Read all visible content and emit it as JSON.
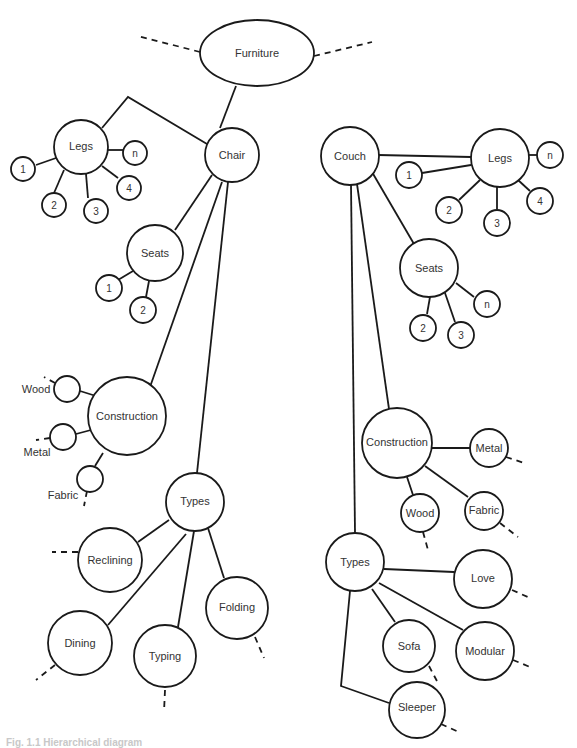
{
  "diagram": {
    "type": "hierarchy",
    "root": "Furniture",
    "nodes": [
      {
        "id": "furniture",
        "label": "Furniture"
      },
      {
        "id": "chair",
        "label": "Chair"
      },
      {
        "id": "chair-legs",
        "label": "Legs"
      },
      {
        "id": "chair-legs-1",
        "label": "1"
      },
      {
        "id": "chair-legs-2",
        "label": "2"
      },
      {
        "id": "chair-legs-3",
        "label": "3"
      },
      {
        "id": "chair-legs-4",
        "label": "4"
      },
      {
        "id": "chair-legs-n",
        "label": "n"
      },
      {
        "id": "chair-seats",
        "label": "Seats"
      },
      {
        "id": "chair-seats-1",
        "label": "1"
      },
      {
        "id": "chair-seats-2",
        "label": "2"
      },
      {
        "id": "chair-construction",
        "label": "Construction"
      },
      {
        "id": "chair-construction-wood",
        "label": "Wood"
      },
      {
        "id": "chair-construction-metal",
        "label": "Metal"
      },
      {
        "id": "chair-construction-fabric",
        "label": "Fabric"
      },
      {
        "id": "chair-types",
        "label": "Types"
      },
      {
        "id": "chair-types-reclining",
        "label": "Reclining"
      },
      {
        "id": "chair-types-dining",
        "label": "Dining"
      },
      {
        "id": "chair-types-typing",
        "label": "Typing"
      },
      {
        "id": "chair-types-folding",
        "label": "Folding"
      },
      {
        "id": "couch",
        "label": "Couch"
      },
      {
        "id": "couch-legs",
        "label": "Legs"
      },
      {
        "id": "couch-legs-1",
        "label": "1"
      },
      {
        "id": "couch-legs-2",
        "label": "2"
      },
      {
        "id": "couch-legs-3",
        "label": "3"
      },
      {
        "id": "couch-legs-4",
        "label": "4"
      },
      {
        "id": "couch-legs-n",
        "label": "n"
      },
      {
        "id": "couch-seats",
        "label": "Seats"
      },
      {
        "id": "couch-seats-2",
        "label": "2"
      },
      {
        "id": "couch-seats-3",
        "label": "3"
      },
      {
        "id": "couch-seats-n",
        "label": "n"
      },
      {
        "id": "couch-construction",
        "label": "Construction"
      },
      {
        "id": "couch-construction-metal",
        "label": "Metal"
      },
      {
        "id": "couch-construction-fabric",
        "label": "Fabric"
      },
      {
        "id": "couch-construction-wood",
        "label": "Wood"
      },
      {
        "id": "couch-types",
        "label": "Types"
      },
      {
        "id": "couch-types-love",
        "label": "Love"
      },
      {
        "id": "couch-types-modular",
        "label": "Modular"
      },
      {
        "id": "couch-types-sofa",
        "label": "Sofa"
      },
      {
        "id": "couch-types-sleeper",
        "label": "Sleeper"
      }
    ],
    "edges": [
      [
        "furniture",
        "chair"
      ],
      [
        "chair",
        "chair-legs"
      ],
      [
        "chair",
        "chair-seats"
      ],
      [
        "chair",
        "chair-construction"
      ],
      [
        "chair",
        "chair-types"
      ],
      [
        "chair-legs",
        "chair-legs-1"
      ],
      [
        "chair-legs",
        "chair-legs-2"
      ],
      [
        "chair-legs",
        "chair-legs-3"
      ],
      [
        "chair-legs",
        "chair-legs-4"
      ],
      [
        "chair-legs",
        "chair-legs-n"
      ],
      [
        "chair-seats",
        "chair-seats-1"
      ],
      [
        "chair-seats",
        "chair-seats-2"
      ],
      [
        "chair-construction",
        "chair-construction-wood"
      ],
      [
        "chair-construction",
        "chair-construction-metal"
      ],
      [
        "chair-construction",
        "chair-construction-fabric"
      ],
      [
        "chair-types",
        "chair-types-reclining"
      ],
      [
        "chair-types",
        "chair-types-dining"
      ],
      [
        "chair-types",
        "chair-types-typing"
      ],
      [
        "chair-types",
        "chair-types-folding"
      ],
      [
        "couch",
        "couch-legs"
      ],
      [
        "couch",
        "couch-seats"
      ],
      [
        "couch",
        "couch-construction"
      ],
      [
        "couch",
        "couch-types"
      ],
      [
        "couch-legs",
        "couch-legs-1"
      ],
      [
        "couch-legs",
        "couch-legs-2"
      ],
      [
        "couch-legs",
        "couch-legs-3"
      ],
      [
        "couch-legs",
        "couch-legs-4"
      ],
      [
        "couch-legs",
        "couch-legs-n"
      ],
      [
        "couch-seats",
        "couch-seats-2"
      ],
      [
        "couch-seats",
        "couch-seats-3"
      ],
      [
        "couch-seats",
        "couch-seats-n"
      ],
      [
        "couch-construction",
        "couch-construction-metal"
      ],
      [
        "couch-construction",
        "couch-construction-fabric"
      ],
      [
        "couch-construction",
        "couch-construction-wood"
      ],
      [
        "couch-types",
        "couch-types-love"
      ],
      [
        "couch-types",
        "couch-types-modular"
      ],
      [
        "couch-types",
        "couch-types-sofa"
      ],
      [
        "couch-types",
        "couch-types-sleeper"
      ]
    ]
  },
  "labels": {
    "furniture": "Furniture",
    "chair": "Chair",
    "couch": "Couch",
    "legs": "Legs",
    "seats": "Seats",
    "construction": "Construction",
    "types": "Types",
    "wood": "Wood",
    "metal": "Metal",
    "fabric": "Fabric",
    "reclining": "Reclining",
    "dining": "Dining",
    "typing": "Typing",
    "folding": "Folding",
    "love": "Love",
    "modular": "Modular",
    "sofa": "Sofa",
    "sleeper": "Sleeper",
    "n1": "1",
    "n2": "2",
    "n3": "3",
    "n4": "4",
    "nn": "n"
  },
  "caption": "Fig. 1.1 Hierarchical diagram"
}
